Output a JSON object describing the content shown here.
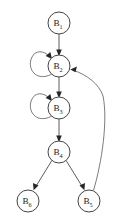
{
  "diagram": {
    "type": "directed-graph",
    "background_color": "#ffffff",
    "node_fill": "#ffffff",
    "node_stroke": "#3a3a3a",
    "edge_color": "#4a4a4a",
    "arrow_color": "#262626",
    "nodes": [
      {
        "id": "B1",
        "base": "B",
        "sub": "1",
        "cx": 59,
        "cy": 23,
        "r": 11
      },
      {
        "id": "B2",
        "base": "B",
        "sub": "2",
        "cx": 59,
        "cy": 66,
        "r": 11
      },
      {
        "id": "B3",
        "base": "B",
        "sub": "3",
        "cx": 59,
        "cy": 108,
        "r": 11
      },
      {
        "id": "B4",
        "base": "B",
        "sub": "4",
        "cx": 59,
        "cy": 152,
        "r": 11
      },
      {
        "id": "B6",
        "base": "B",
        "sub": "6",
        "cx": 28,
        "cy": 201,
        "r": 11
      },
      {
        "id": "B5",
        "base": "B",
        "sub": "5",
        "cx": 89,
        "cy": 201,
        "r": 11
      }
    ],
    "edges": [
      {
        "from": "B1",
        "to": "B2",
        "kind": "straight"
      },
      {
        "from": "B2",
        "to": "B3",
        "kind": "straight"
      },
      {
        "from": "B3",
        "to": "B4",
        "kind": "straight"
      },
      {
        "from": "B4",
        "to": "B6",
        "kind": "straight"
      },
      {
        "from": "B4",
        "to": "B5",
        "kind": "straight"
      },
      {
        "from": "B2",
        "to": "B2",
        "kind": "self-loop"
      },
      {
        "from": "B3",
        "to": "B3",
        "kind": "self-loop"
      },
      {
        "from": "B5",
        "to": "B2",
        "kind": "back-edge-curve"
      }
    ]
  }
}
